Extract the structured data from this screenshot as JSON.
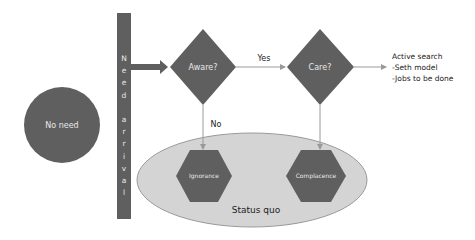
{
  "diagram": {
    "start_node": {
      "label": "No need",
      "shape": "circle"
    },
    "gate": {
      "label": "Need arrival",
      "letters": [
        "N",
        "e",
        "e",
        "d",
        "",
        "a",
        "r",
        "r",
        "i",
        "v",
        "a",
        "l"
      ],
      "shape": "vertical-bar"
    },
    "decisions": [
      {
        "id": "aware",
        "label": "Aware?",
        "shape": "diamond"
      },
      {
        "id": "care",
        "label": "Care?",
        "shape": "diamond"
      }
    ],
    "edges": [
      {
        "from": "gate",
        "to": "aware",
        "label": ""
      },
      {
        "from": "aware",
        "to": "care",
        "label": "Yes"
      },
      {
        "from": "aware",
        "to": "ignorance",
        "label": "No"
      },
      {
        "from": "care",
        "to": "complacence",
        "label": ""
      },
      {
        "from": "care",
        "to": "outcome",
        "label": ""
      }
    ],
    "outcome": {
      "lines": [
        "Active search",
        "-Seth model",
        "-Jobs to be done"
      ]
    },
    "status_quo": {
      "label": "Status quo",
      "states": [
        {
          "id": "ignorance",
          "label": "Ignorance",
          "shape": "hexagon"
        },
        {
          "id": "complacence",
          "label": "Complacence",
          "shape": "hexagon"
        }
      ]
    },
    "colors": {
      "dark_fill": "#5f5f5f",
      "ellipse_fill": "#d4d4d4",
      "ellipse_stroke": "#9a9a9a",
      "line": "#9a9a9a",
      "text_dark": "#222222",
      "text_light": "#e8e8e8"
    }
  }
}
